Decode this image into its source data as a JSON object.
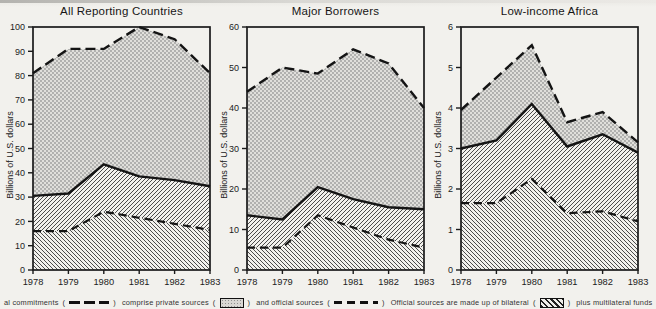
{
  "figure": {
    "ylabel": "Billions of U.S. dollars",
    "years": [
      "1978",
      "1979",
      "1980",
      "1981",
      "1982",
      "1983"
    ]
  },
  "chart_data": [
    {
      "type": "area",
      "title": "All Reporting Countries",
      "ylabel": "Billions of U.S. dollars",
      "x": [
        "1978",
        "1979",
        "1980",
        "1981",
        "1982",
        "1983"
      ],
      "ylim": [
        0,
        100
      ],
      "yticks": [
        0,
        10,
        20,
        30,
        40,
        50,
        60,
        70,
        80,
        90,
        100
      ],
      "grid": false,
      "series": [
        {
          "name": "Total commitments",
          "style": "long-dash",
          "values": [
            81,
            91,
            91,
            100,
            95,
            81
          ]
        },
        {
          "name": "Official sources (top of official band)",
          "style": "solid",
          "values": [
            30.5,
            31.5,
            43.5,
            38.5,
            37,
            34.5
          ]
        },
        {
          "name": "Bilateral (top of bilateral band)",
          "style": "dash",
          "values": [
            16,
            16,
            24,
            21.5,
            19,
            16.5
          ]
        }
      ],
      "areas": [
        {
          "name": "private sources",
          "between": [
            "official",
            "total"
          ],
          "fill": "stipple"
        },
        {
          "name": "multilateral funds",
          "between": [
            "bilateral",
            "official"
          ],
          "fill": "hatch-forward"
        },
        {
          "name": "bilateral",
          "between": [
            "baseline",
            "bilateral"
          ],
          "fill": "hatch-back"
        }
      ]
    },
    {
      "type": "area",
      "title": "Major Borrowers",
      "ylabel": "Billions of U.S. dollars",
      "x": [
        "1978",
        "1979",
        "1980",
        "1981",
        "1982",
        "1983"
      ],
      "ylim": [
        0,
        60
      ],
      "yticks": [
        0,
        10,
        20,
        30,
        40,
        50,
        60
      ],
      "grid": false,
      "series": [
        {
          "name": "Total commitments",
          "style": "long-dash",
          "values": [
            44,
            50,
            48.5,
            54.5,
            51,
            40
          ]
        },
        {
          "name": "Official sources (top of official band)",
          "style": "solid",
          "values": [
            13.5,
            12.5,
            20.5,
            17.5,
            15.5,
            15
          ]
        },
        {
          "name": "Bilateral (top of bilateral band)",
          "style": "dash",
          "values": [
            5.5,
            5.5,
            13.5,
            10.5,
            7.5,
            5.5
          ]
        }
      ],
      "areas": [
        {
          "name": "private sources",
          "between": [
            "official",
            "total"
          ],
          "fill": "stipple"
        },
        {
          "name": "multilateral funds",
          "between": [
            "bilateral",
            "official"
          ],
          "fill": "hatch-forward"
        },
        {
          "name": "bilateral",
          "between": [
            "baseline",
            "bilateral"
          ],
          "fill": "hatch-back"
        }
      ]
    },
    {
      "type": "area",
      "title": "Low-income Africa",
      "ylabel": "Billions of U.S. dollars",
      "x": [
        "1978",
        "1979",
        "1980",
        "1981",
        "1982",
        "1983"
      ],
      "ylim": [
        0,
        6
      ],
      "yticks": [
        0,
        1,
        2,
        3,
        4,
        5,
        6
      ],
      "grid": false,
      "series": [
        {
          "name": "Total commitments",
          "style": "long-dash",
          "values": [
            3.95,
            4.75,
            5.55,
            3.65,
            3.9,
            3.15
          ]
        },
        {
          "name": "Official sources (top of official band)",
          "style": "solid",
          "values": [
            3.0,
            3.2,
            4.1,
            3.05,
            3.35,
            2.9
          ]
        },
        {
          "name": "Bilateral (top of bilateral band)",
          "style": "dash",
          "values": [
            1.65,
            1.65,
            2.25,
            1.4,
            1.45,
            1.2
          ]
        }
      ],
      "areas": [
        {
          "name": "private sources",
          "between": [
            "official",
            "total"
          ],
          "fill": "stipple"
        },
        {
          "name": "multilateral funds",
          "between": [
            "bilateral",
            "official"
          ],
          "fill": "hatch-forward"
        },
        {
          "name": "bilateral",
          "between": [
            "baseline",
            "bilateral"
          ],
          "fill": "hatch-back"
        }
      ]
    }
  ],
  "legend": {
    "open": "(",
    "close": ")",
    "items": [
      {
        "text": "al commitments",
        "symbol": "long-dash-line"
      },
      {
        "text": "comprise private sources",
        "symbol": "stipple-box"
      },
      {
        "text": "and official sources",
        "symbol": "dash-line"
      },
      {
        "text": "Official sources are made up of bilateral",
        "symbol": "bilateral-hatch-box"
      },
      {
        "text": "plus multilateral funds",
        "symbol": "multilateral-hatch-box"
      }
    ]
  },
  "colors": {
    "line": "#141414",
    "frame": "#1a1a1a",
    "stipple_dot": "#9a9a9a",
    "stipple_bg": "#e0dfdb",
    "hatch_line": "#4c4c4c",
    "paper": "#f2f1ed"
  }
}
